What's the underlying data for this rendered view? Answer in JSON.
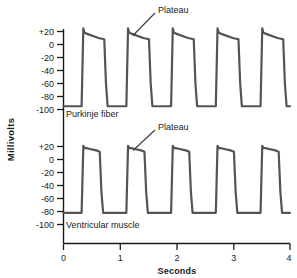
{
  "figure": {
    "background_color": "#ffffff",
    "trace_color": "#545454",
    "axis_color": "#1a1a1a",
    "annotation_line_color": "#3a3a3a"
  },
  "axes": {
    "y_title": "Millivolts",
    "x_title": "Seconds",
    "x_ticks": [
      "0",
      "1",
      "2",
      "3",
      "4"
    ],
    "x_tick_values": [
      0,
      1,
      2,
      3,
      4
    ],
    "y_ticks_top": [
      "+20",
      "0",
      "-20",
      "-40",
      "-60",
      "-80",
      "-100"
    ],
    "y_ticks_bottom": [
      "+20",
      "0",
      "-20",
      "-40",
      "-60",
      "-80",
      "-100"
    ],
    "y_tick_values": [
      20,
      0,
      -20,
      -40,
      -60,
      -80,
      -100
    ]
  },
  "annotations": {
    "plateau_top": "Plateau",
    "plateau_bottom": "Plateau",
    "series_top": "Purkinje fiber",
    "series_bottom": "Ventricular muscle"
  },
  "chart_data": {
    "type": "line",
    "title": "",
    "xlabel": "Seconds",
    "ylabel": "Millivolts",
    "xlim": [
      0,
      4
    ],
    "ylim": [
      -110,
      30
    ],
    "grid": false,
    "legend": "inline-labels",
    "panels": [
      {
        "name": "Purkinje fiber",
        "label": "Purkinje fiber",
        "annotation": "Plateau",
        "annotation_target_seconds": 1.17,
        "resting_potential_mv": -95,
        "peak_overshoot_mv": 25,
        "plateau_start_mv": 18,
        "plateau_end_mv": 8,
        "action_potential_duration_s": 0.42,
        "cycle_period_s": 0.79,
        "beat_onsets_seconds": [
          0.33,
          1.12,
          1.91,
          2.7,
          3.49
        ],
        "series": [
          {
            "name": "Purkinje fiber membrane potential",
            "x": [
              0.0,
              0.32,
              0.35,
              0.37,
              0.43,
              0.62,
              0.72,
              0.75,
              0.78,
              1.11,
              1.14,
              1.16,
              1.22,
              1.41,
              1.51,
              1.54,
              1.57,
              1.9,
              1.93,
              1.95,
              2.01,
              2.2,
              2.3,
              2.33,
              2.36,
              2.69,
              2.72,
              2.74,
              2.8,
              2.99,
              3.09,
              3.12,
              3.15,
              3.48,
              3.51,
              3.53,
              3.59,
              3.78,
              3.88,
              3.91,
              3.94,
              4.0
            ],
            "y": [
              -95,
              -95,
              25,
              18,
              16,
              10,
              8,
              -60,
              -95,
              -95,
              25,
              18,
              16,
              10,
              8,
              -60,
              -95,
              -95,
              25,
              18,
              16,
              10,
              8,
              -60,
              -95,
              -95,
              25,
              18,
              16,
              10,
              8,
              -60,
              -95,
              -95,
              25,
              18,
              16,
              10,
              8,
              -60,
              -95,
              -95
            ]
          }
        ]
      },
      {
        "name": "Ventricular muscle",
        "label": "Ventricular muscle",
        "annotation": "Plateau",
        "annotation_target_seconds": 1.17,
        "resting_potential_mv": -82,
        "peak_overshoot_mv": 21,
        "plateau_start_mv": 18,
        "plateau_end_mv": 12,
        "action_potential_duration_s": 0.33,
        "cycle_period_s": 0.79,
        "beat_onsets_seconds": [
          0.33,
          1.12,
          1.91,
          2.7,
          3.49
        ],
        "series": [
          {
            "name": "Ventricular muscle membrane potential",
            "x": [
              0.0,
              0.32,
              0.35,
              0.37,
              0.43,
              0.58,
              0.64,
              0.67,
              0.7,
              1.11,
              1.14,
              1.16,
              1.22,
              1.37,
              1.43,
              1.46,
              1.49,
              1.9,
              1.93,
              1.95,
              2.01,
              2.16,
              2.22,
              2.25,
              2.28,
              2.69,
              2.72,
              2.74,
              2.8,
              2.95,
              3.01,
              3.04,
              3.07,
              3.48,
              3.51,
              3.53,
              3.59,
              3.74,
              3.8,
              3.83,
              3.86,
              4.0
            ],
            "y": [
              -82,
              -82,
              21,
              18,
              17,
              14,
              12,
              -50,
              -82,
              -82,
              21,
              18,
              17,
              14,
              12,
              -50,
              -82,
              -82,
              21,
              18,
              17,
              14,
              12,
              -50,
              -82,
              -82,
              21,
              18,
              17,
              14,
              12,
              -50,
              -82,
              -82,
              21,
              18,
              17,
              14,
              12,
              -50,
              -82,
              -82
            ]
          }
        ]
      }
    ]
  }
}
